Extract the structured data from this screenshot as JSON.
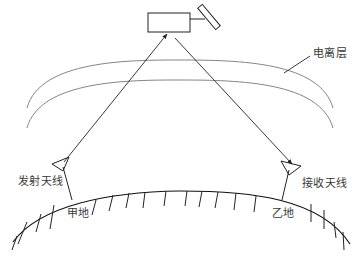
{
  "diagram": {
    "type": "satellite-communication-schematic",
    "components": {
      "satellite": "satellite-icon",
      "ionosphere": "ionosphere-layer",
      "earth": "earth-surface",
      "transmit_antenna": "antenna-icon",
      "receive_antenna": "antenna-icon"
    },
    "labels": {
      "ionosphere": "电离层",
      "transmit_antenna": "发射天线",
      "receive_antenna": "接收天线",
      "site_a": "甲地",
      "site_b": "乙地"
    },
    "links": [
      {
        "from": "甲地",
        "to": "satellite",
        "direction": "uplink"
      },
      {
        "from": "satellite",
        "to": "乙地",
        "direction": "downlink"
      }
    ],
    "colors": {
      "line": "#222222",
      "ionosphere": "#777777",
      "text": "#3a3a3a"
    }
  }
}
